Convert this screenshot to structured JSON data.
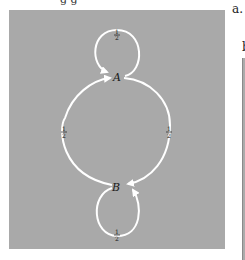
{
  "header_fragment": "g         g",
  "side_labels": {
    "a": "a.",
    "b": "b"
  },
  "diagram": {
    "type": "markov-chain-state-diagram",
    "background_color": "#a9a9a9",
    "edge_color": "#ffffff",
    "nodes": [
      {
        "id": "A",
        "label": "A"
      },
      {
        "id": "B",
        "label": "B"
      }
    ],
    "edges": [
      {
        "from": "A",
        "to": "A",
        "label": "1/2",
        "label_num": "1",
        "label_den": "2"
      },
      {
        "from": "A",
        "to": "B",
        "label": "1/2",
        "label_num": "1",
        "label_den": "2"
      },
      {
        "from": "B",
        "to": "A",
        "label": "1/2",
        "label_num": "1",
        "label_den": "2"
      },
      {
        "from": "B",
        "to": "B",
        "label": "1/2",
        "label_num": "1",
        "label_den": "2"
      }
    ]
  }
}
